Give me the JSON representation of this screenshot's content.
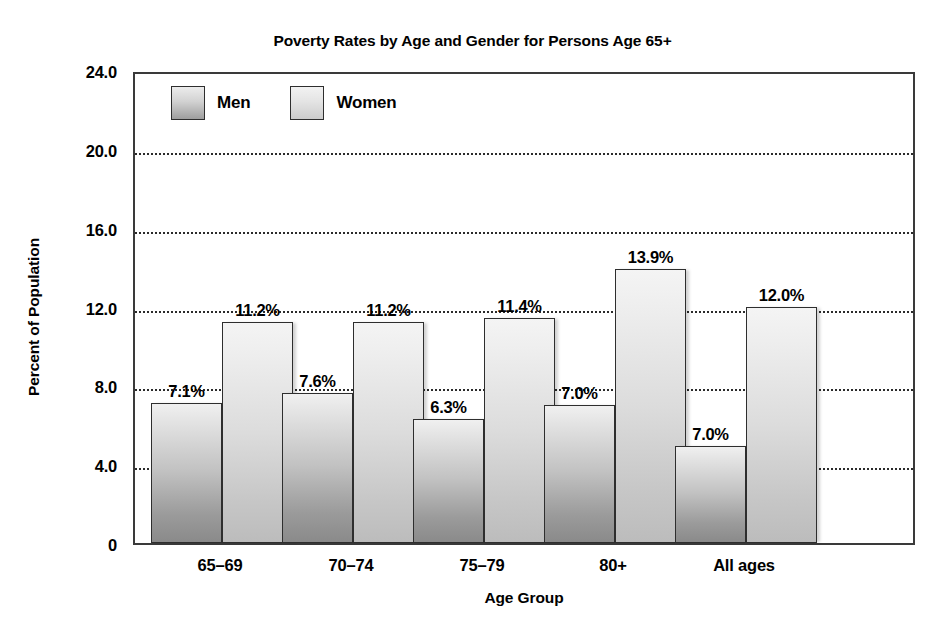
{
  "chart_data": {
    "type": "bar",
    "title": "Poverty Rates by Age and Gender for Persons Age 65+",
    "xlabel": "Age Group",
    "ylabel": "Percent of Population",
    "categories": [
      "65–69",
      "70–74",
      "75–79",
      "80+",
      "All ages"
    ],
    "series": [
      {
        "name": "Men",
        "values": [
          7.1,
          7.6,
          6.3,
          7.0,
          7.0
        ],
        "bar_tops": [
          7.1,
          7.6,
          6.3,
          7.0,
          4.9
        ],
        "labels": [
          "7.1%",
          "7.6%",
          "6.3%",
          "7.0%",
          "7.0%"
        ],
        "color": "#9b9b9b"
      },
      {
        "name": "Women",
        "values": [
          11.2,
          11.2,
          11.4,
          13.9,
          12.0
        ],
        "bar_tops": [
          11.2,
          11.2,
          11.4,
          13.9,
          12.0
        ],
        "labels": [
          "11.2%",
          "11.2%",
          "11.4%",
          "13.9%",
          "12.0%"
        ],
        "color": "#cccccc"
      }
    ],
    "ylim": [
      0,
      24
    ],
    "yticks": [
      24.0,
      20.0,
      16.0,
      12.0,
      8.0,
      4.0,
      0
    ],
    "ytick_labels": [
      "24.0",
      "20.0",
      "16.0",
      "12.0",
      "8.0",
      "4.0",
      "0"
    ],
    "grid": true,
    "grid_axis": "y",
    "legend_position": "top-left-inside"
  },
  "legend": {
    "entries": [
      {
        "label": "Men",
        "swatch": "men-swatch"
      },
      {
        "label": "Women",
        "swatch": "women-swatch"
      }
    ]
  }
}
